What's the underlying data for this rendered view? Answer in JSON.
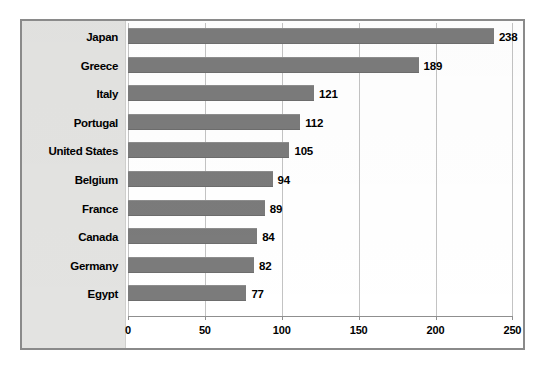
{
  "chart_data": {
    "type": "bar",
    "orientation": "horizontal",
    "title": "",
    "xlabel": "",
    "ylabel": "",
    "categories": [
      "Japan",
      "Greece",
      "Italy",
      "Portugal",
      "United States",
      "Belgium",
      "France",
      "Canada",
      "Germany",
      "Egypt"
    ],
    "values": [
      238,
      189,
      121,
      112,
      105,
      94,
      89,
      84,
      82,
      77
    ],
    "value_labels": [
      "238",
      "189",
      "121",
      "112",
      "105",
      "94",
      "89",
      "84",
      "82",
      "77"
    ],
    "xlim": [
      0,
      250
    ],
    "xticks": [
      0,
      50,
      100,
      150,
      200,
      250
    ],
    "xtick_labels": [
      "0",
      "50",
      "100",
      "150",
      "200",
      "250"
    ],
    "grid": "vertical",
    "legend": "none",
    "series": [
      {
        "name": "",
        "values": [
          238,
          189,
          121,
          112,
          105,
          94,
          89,
          84,
          82,
          77
        ]
      }
    ],
    "colors": {
      "bar": "#7b7b7b",
      "gridline": "#c3c3c3",
      "axis": "#8f8f8f",
      "category_panel": "#e3e3e1",
      "frame_border": "#8a8a8a",
      "text": "#000000",
      "plot_background": "#ffffff"
    }
  }
}
